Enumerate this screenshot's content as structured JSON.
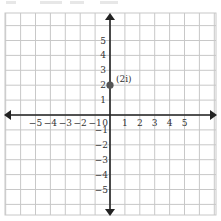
{
  "diagram": {
    "type": "coordinate-plane",
    "x_axis": {
      "min": -5,
      "max": 5,
      "tick_labels": [
        "−5",
        "−4",
        "−3",
        "−2",
        "−1",
        "0",
        "1",
        "2",
        "3",
        "4",
        "5"
      ]
    },
    "y_axis": {
      "min": -5,
      "max": 5,
      "tick_labels_positive": [
        "1",
        "2",
        "3",
        "4",
        "5"
      ],
      "tick_labels_negative": [
        "−1",
        "−2",
        "−3",
        "−4",
        "−5"
      ]
    },
    "points": [
      {
        "x": 0,
        "y": 2,
        "label": "(2i)",
        "color": "#555555"
      }
    ],
    "colors": {
      "grid": "#c8c8c8",
      "axis": "#222222",
      "point": "#555555"
    }
  }
}
